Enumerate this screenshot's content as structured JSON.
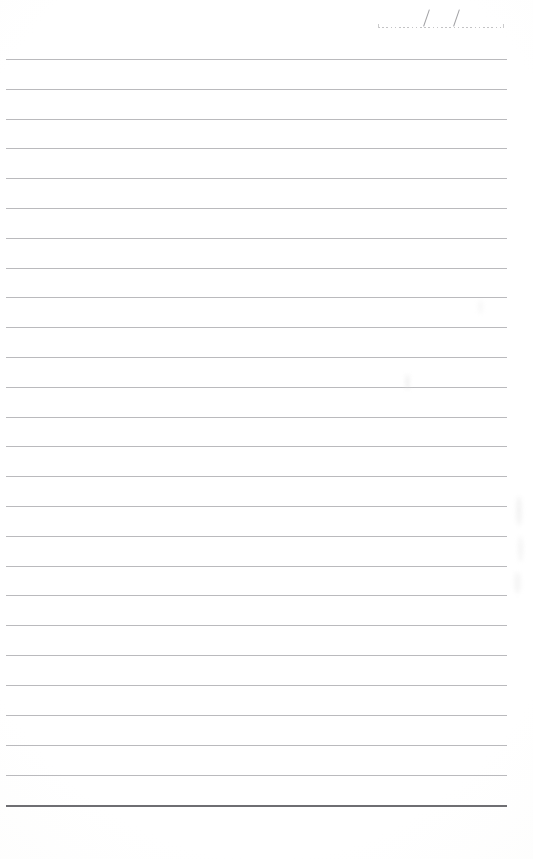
{
  "document": {
    "kind": "blank-ruled-notepad-page",
    "title": "Blank lined notepad page",
    "paper_color": "#fefefe",
    "page_width": 533,
    "page_height": 859
  },
  "date_field": {
    "name": "date-line",
    "value": "",
    "placeholder": "",
    "separator": "/",
    "separator_count": 2,
    "style": "dotted",
    "dot_color": "#b9b9bb",
    "slash_color": "#9a9a9d",
    "left": 376,
    "top": 8,
    "width": 132
  },
  "ruling": {
    "line_count": 26,
    "first_line_y": 59,
    "spacing": 29.85,
    "left_margin": 6,
    "right_margin": 26,
    "line_width": 501,
    "line_color": "#a9a9ad",
    "bottom_rule_color": "#6e6e72",
    "bottom_rule_y": 805,
    "bottom_rule_thickness": 2,
    "lines_y": [
      59,
      89,
      119,
      148,
      178,
      208,
      238,
      268,
      297,
      327,
      357,
      387,
      417,
      446,
      476,
      506,
      536,
      566,
      595,
      625,
      655,
      685,
      715,
      745,
      775,
      805
    ],
    "line_contents": [
      "",
      "",
      "",
      "",
      "",
      "",
      "",
      "",
      "",
      "",
      "",
      "",
      "",
      "",
      "",
      "",
      "",
      "",
      "",
      "",
      "",
      "",
      "",
      "",
      "",
      ""
    ]
  },
  "artifacts": {
    "smudges": [
      {
        "name": "smudge-mid",
        "x": 406,
        "y": 374
      },
      {
        "name": "smudge-right-1",
        "x": 516,
        "y": 496
      },
      {
        "name": "smudge-right-2",
        "x": 518,
        "y": 536
      },
      {
        "name": "smudge-right-3",
        "x": 514,
        "y": 572
      },
      {
        "name": "smudge-top-right",
        "x": 478,
        "y": 300
      }
    ]
  }
}
